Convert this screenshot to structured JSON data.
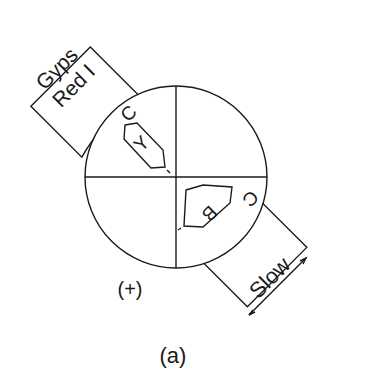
{
  "diagram": {
    "accessory_plate": {
      "line1": "Gyps",
      "line2": "Red I"
    },
    "slow_plate": {
      "label": "Slow"
    },
    "crystal_upper_left": {
      "letter": "Y",
      "c_label": "C"
    },
    "crystal_lower_right": {
      "letter": "B",
      "c_label": "C"
    },
    "sign_label": "(+)",
    "caption": "(a)"
  },
  "colors": {
    "line": "#1a1a1a",
    "background": "#ffffff"
  }
}
